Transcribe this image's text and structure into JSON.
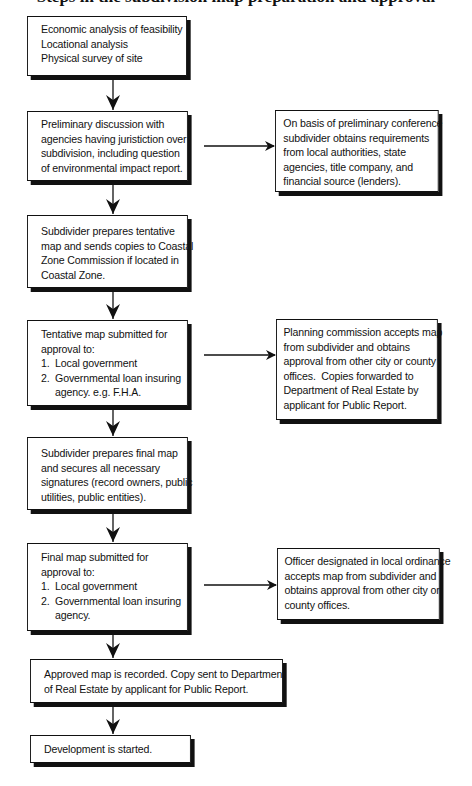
{
  "title": "Steps in the subdivision map preparation and approval",
  "colors": {
    "ink": "#111111",
    "background": "#ffffff"
  },
  "flowchart": {
    "main_steps": [
      {
        "id": "step-1",
        "lines": "Economic analysis of feasibility\nLocational analysis\nPhysical survey of site"
      },
      {
        "id": "step-2",
        "lines": "Preliminary discussion with\nagencies having juristiction over\nsubdivision, including question\nof environmental impact report."
      },
      {
        "id": "step-3",
        "lines": "Subdivider prepares tentative\nmap and sends copies to Coastal\nZone Commission if located in\nCoastal Zone."
      },
      {
        "id": "step-4",
        "lines": "Tentative map submitted for\napproval to:\n1.  Local government\n2.  Governmental loan insuring\n     agency. e.g. F.H.A."
      },
      {
        "id": "step-5",
        "lines": "Subdivider prepares final map\nand secures all necessary\nsignatures (record owners, public\nutilities, public entities)."
      },
      {
        "id": "step-6",
        "lines": "Final map submitted for\napproval to:\n1.  Local government\n2.  Governmental loan insuring\n     agency."
      },
      {
        "id": "step-7",
        "lines": "Approved map is recorded. Copy sent to Department\nof Real Estate by applicant for Public Report."
      },
      {
        "id": "step-8",
        "lines": "Development is started."
      }
    ],
    "side_notes": [
      {
        "id": "note-1",
        "from": "step-2",
        "lines": "On basis of preliminary conference\nsubdivider obtains requirements\nfrom local authorities, state\nagencies, title company, and\nfinancial source (lenders)."
      },
      {
        "id": "note-2",
        "from": "step-4",
        "lines": "Planning commission accepts map\nfrom subdivider and obtains\napproval from other city or county\noffices.  Copies forwarded to\nDepartment of Real Estate by\napplicant for Public Report."
      },
      {
        "id": "note-3",
        "from": "step-6",
        "lines": "Officer designated in local ordinance\naccepts map from subdivider and\nobtains approval from other city or\ncounty offices."
      }
    ]
  }
}
